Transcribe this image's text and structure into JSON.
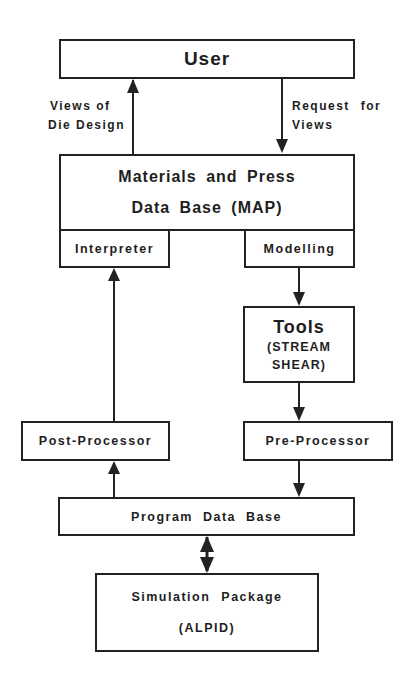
{
  "diagram": {
    "nodes": {
      "user": {
        "label": "User"
      },
      "map": {
        "line1": "Materials and Press",
        "line2": "Data Base (MAP)"
      },
      "interpreter": {
        "label": "Interpreter"
      },
      "modelling": {
        "label": "Modelling"
      },
      "tools": {
        "title": "Tools",
        "line1": "(STREAM",
        "line2": "SHEAR)"
      },
      "post_processor": {
        "label": "Post-Processor"
      },
      "pre_processor": {
        "label": "Pre-Processor"
      },
      "program_db": {
        "label": "Program Data Base"
      },
      "simulation": {
        "line1": "Simulation Package",
        "line2": "(ALPID)"
      }
    },
    "edge_labels": {
      "views_of_die_design": {
        "line1": "Views of",
        "line2": "Die Design"
      },
      "request_for_views": {
        "line1": "Request for",
        "line2": "Views"
      }
    },
    "edges": [
      {
        "from": "map",
        "to": "user",
        "label": "Views of Die Design"
      },
      {
        "from": "user",
        "to": "map",
        "label": "Request for Views"
      },
      {
        "from": "post_processor",
        "to": "interpreter"
      },
      {
        "from": "modelling",
        "to": "tools"
      },
      {
        "from": "tools",
        "to": "pre_processor"
      },
      {
        "from": "program_db",
        "to": "post_processor"
      },
      {
        "from": "pre_processor",
        "to": "program_db"
      },
      {
        "from": "program_db",
        "to": "simulation",
        "bidirectional": true
      }
    ]
  }
}
